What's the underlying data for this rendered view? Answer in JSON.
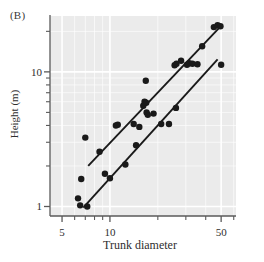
{
  "figure": {
    "panel_label": "(B)",
    "background_color": "#ffffff",
    "plot_background_color": "#ebebeb",
    "grid_color": "#ffffff",
    "axis_color": "#5a5a5a",
    "point_color": "#1a1a1a",
    "line_color": "#1a1a1a"
  },
  "chart_data": {
    "type": "scatter",
    "title": "",
    "xlabel": "Trunk diameter",
    "ylabel": "Height (m)",
    "xscale": "log",
    "yscale": "log",
    "xlim": [
      4.2,
      62
    ],
    "ylim": [
      0.85,
      26
    ],
    "grid": true,
    "legend": "none",
    "xticks_major": [
      5,
      10,
      50
    ],
    "xticklabels": [
      "5",
      "10",
      "50"
    ],
    "xticks_minor": [
      6,
      7,
      8,
      9,
      20,
      30,
      40,
      60
    ],
    "yticks_major": [
      1,
      10
    ],
    "yticklabels": [
      "1",
      "10"
    ],
    "yticks_minor": [
      2,
      3,
      4,
      5,
      6,
      7,
      8,
      9,
      20
    ],
    "series": [
      {
        "name": "upper-group",
        "marker": "filled-circle",
        "points": [
          [
            6.3,
            1.15
          ],
          [
            6.6,
            1.6
          ],
          [
            7.0,
            3.25
          ],
          [
            7.2,
            1.0
          ],
          [
            8.6,
            2.55
          ],
          [
            10.9,
            4.0
          ],
          [
            11.2,
            4.05
          ],
          [
            14.1,
            4.1
          ],
          [
            16.2,
            5.6
          ],
          [
            16.5,
            6.0
          ],
          [
            16.9,
            5.9
          ],
          [
            16.8,
            8.6
          ],
          [
            17.3,
            4.8
          ],
          [
            25.5,
            11.2
          ],
          [
            26.2,
            11.5
          ],
          [
            28.0,
            12.1
          ],
          [
            31.5,
            11.6
          ],
          [
            33.0,
            11.5
          ],
          [
            38.0,
            15.5
          ],
          [
            45.0,
            21.5
          ],
          [
            47.5,
            22.2
          ],
          [
            49.5,
            21.8
          ]
        ]
      },
      {
        "name": "lower-group",
        "marker": "filled-circle",
        "points": [
          [
            6.5,
            1.02
          ],
          [
            9.3,
            1.75
          ],
          [
            10.0,
            1.62
          ],
          [
            12.5,
            2.05
          ],
          [
            14.6,
            2.85
          ],
          [
            15.3,
            3.9
          ],
          [
            17.0,
            5.0
          ],
          [
            18.8,
            4.9
          ],
          [
            21.0,
            4.1
          ],
          [
            23.5,
            4.1
          ],
          [
            26.0,
            5.4
          ],
          [
            30.5,
            11.3
          ],
          [
            35.5,
            11.4
          ],
          [
            50.0,
            11.3
          ]
        ]
      }
    ],
    "fit_lines": [
      {
        "name": "upper-regression-line",
        "x_start": 7.3,
        "y_start": 2.0,
        "x_end": 51.0,
        "y_end": 22.5
      },
      {
        "name": "lower-regression-line",
        "x_start": 6.8,
        "y_start": 0.98,
        "x_end": 47.5,
        "y_end": 12.4
      }
    ]
  }
}
